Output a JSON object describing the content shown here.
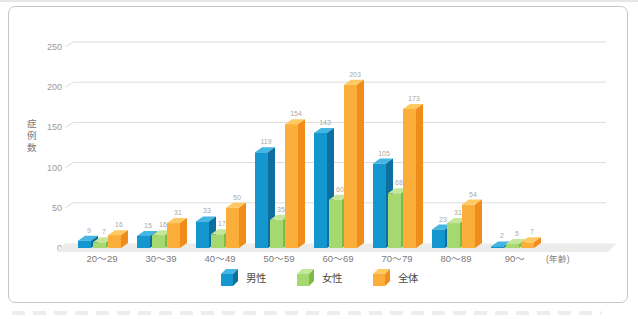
{
  "chart_data": {
    "type": "bar",
    "variant": "3d-grouped-column",
    "title": "",
    "categories": [
      "20〜29",
      "30〜39",
      "40〜49",
      "50〜59",
      "60〜69",
      "70〜79",
      "80〜89",
      "90〜"
    ],
    "series": [
      {
        "name": "男性",
        "values": [
          9,
          15,
          33,
          119,
          143,
          105,
          23,
          2
        ],
        "colors": {
          "front": "#1496cf",
          "top": "#45b5e2",
          "side": "#0c6fa0"
        }
      },
      {
        "name": "女性",
        "values": [
          7,
          16,
          17,
          35,
          60,
          68,
          31,
          5
        ],
        "colors": {
          "front": "#a6d870",
          "top": "#c4e79a",
          "side": "#7cba4a"
        }
      },
      {
        "name": "全体",
        "values": [
          16,
          31,
          50,
          154,
          203,
          173,
          54,
          7
        ],
        "colors": {
          "front": "#fbaf3a",
          "top": "#fdc960",
          "side": "#ef8c1a"
        }
      }
    ],
    "ylabel": "症例数",
    "xlabel": "",
    "x_unit_label": "(年齢)",
    "yticks": [
      0,
      50,
      100,
      150,
      200,
      250
    ],
    "ylim": [
      0,
      250
    ],
    "grid": true,
    "data_labels": true,
    "legend_position": "bottom"
  },
  "colors": {
    "gridline": "#dcdcdc",
    "floor": "#ececea",
    "tick_label": "#9a9a9a",
    "category_label": "#7a7a7a",
    "data_label": "#a9a9a9",
    "legend_text": "#4a4a4a",
    "frame_border": "#c6c6c6"
  }
}
